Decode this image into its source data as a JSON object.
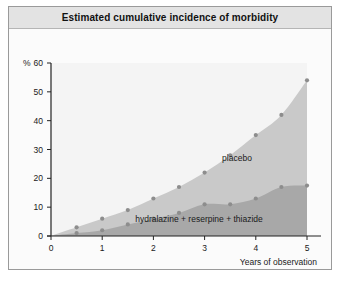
{
  "figure": {
    "title": "Estimated cumulative incidence of morbidity"
  },
  "axes": {
    "y_unit_label": "%",
    "x_title": "Years of observation",
    "y_ticks": [
      "0",
      "10",
      "20",
      "30",
      "40",
      "50",
      "60"
    ],
    "x_ticks": [
      "0",
      "1",
      "2",
      "3",
      "4",
      "5"
    ]
  },
  "labels": {
    "placebo": "placebo",
    "treatment": "hydralazine + reserpine + thiazide"
  },
  "colors": {
    "placebo_fill": "#c9c9c9",
    "treatment_fill": "#a8a8a8",
    "plot_background": "#f4f4f4",
    "marker": "#8d8d8d",
    "title_bar": "#e3e3e3",
    "frame_border": "#9a9a9a"
  },
  "chart_data": {
    "type": "area",
    "title": "Estimated cumulative incidence of morbidity",
    "xlabel": "Years of observation",
    "ylabel": "%",
    "xlim": [
      0,
      5
    ],
    "ylim": [
      0,
      60
    ],
    "grid": false,
    "legend": "inline annotations",
    "x": [
      0,
      0.5,
      1,
      1.5,
      2,
      2.5,
      3,
      3.5,
      4,
      4.5,
      5
    ],
    "series": [
      {
        "name": "placebo",
        "values": [
          0,
          3,
          6,
          9,
          13,
          17,
          22,
          28,
          35,
          42,
          54
        ]
      },
      {
        "name": "hydralazine + reserpine + thiazide",
        "values": [
          0,
          1,
          2,
          4,
          6,
          8,
          11,
          11,
          13,
          17,
          17.5
        ]
      }
    ]
  }
}
